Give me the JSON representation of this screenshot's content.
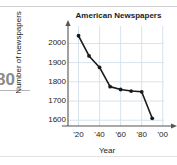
{
  "page": {
    "margin_number": "80",
    "top_cut_text": "·····  ·····"
  },
  "chart_data": {
    "type": "line",
    "title": "American Newspapers",
    "xlabel": "Year",
    "ylabel": "Number of newspapers",
    "grid": true,
    "legend": "none",
    "x": [
      1920,
      1930,
      1940,
      1950,
      1960,
      1970,
      1980,
      1990
    ],
    "values": [
      2040,
      1935,
      1875,
      1775,
      1760,
      1752,
      1748,
      1610
    ],
    "xtick_labels": [
      "'20",
      "'40",
      "'60",
      "'80",
      "'00"
    ],
    "xtick_values": [
      1920,
      1940,
      1960,
      1980,
      2000
    ],
    "ytick_labels": [
      "2000",
      "1900",
      "1800",
      "1700",
      "1600"
    ],
    "ytick_values": [
      2000,
      1900,
      1800,
      1700,
      1600
    ],
    "xlim": [
      1910,
      2005
    ],
    "ylim": [
      1570,
      2070
    ],
    "marker": "filled-circle",
    "line_color": "#1a1a1a",
    "grid_color": "#d7e3ec",
    "axis_color": "#555555"
  }
}
